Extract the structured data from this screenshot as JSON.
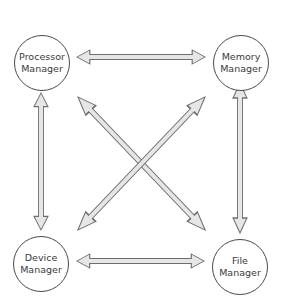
{
  "diagram": {
    "nodes": [
      {
        "id": "processor",
        "line1": "Processor",
        "line2": "Manager"
      },
      {
        "id": "memory",
        "line1": "Memory",
        "line2": "Manager"
      },
      {
        "id": "device",
        "line1": "Device",
        "line2": "Manager"
      },
      {
        "id": "file",
        "line1": "File",
        "line2": "Manager"
      }
    ],
    "edges": [
      {
        "from": "processor",
        "to": "memory",
        "type": "bidirectional"
      },
      {
        "from": "device",
        "to": "file",
        "type": "bidirectional"
      },
      {
        "from": "processor",
        "to": "device",
        "type": "bidirectional"
      },
      {
        "from": "memory",
        "to": "file",
        "type": "bidirectional"
      },
      {
        "from": "processor",
        "to": "file",
        "type": "bidirectional"
      },
      {
        "from": "memory",
        "to": "device",
        "type": "bidirectional"
      }
    ],
    "colors": {
      "arrow_fill": "#e6e6e6",
      "arrow_stroke": "#6e6e6e",
      "node_stroke": "#4a4a4a",
      "text": "#3a3a3a"
    }
  }
}
